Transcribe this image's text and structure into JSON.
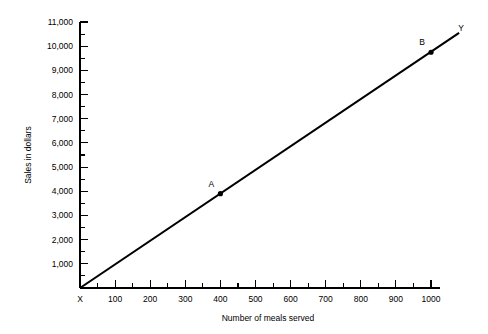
{
  "chart_data": {
    "type": "line",
    "title": "",
    "subtitle": "",
    "xlabel": "Number of meals served",
    "ylabel": "Sales in dollars",
    "xlim": [
      0,
      1000
    ],
    "ylim": [
      0,
      11000
    ],
    "grid": false,
    "legend": null,
    "x_origin_label": "X",
    "y_terminal_label": "Y",
    "x_ticks": [
      {
        "value": 0,
        "label": "X"
      },
      {
        "value": 100,
        "label": "100"
      },
      {
        "value": 200,
        "label": "200"
      },
      {
        "value": 300,
        "label": "300"
      },
      {
        "value": 400,
        "label": "400"
      },
      {
        "value": 500,
        "label": "500"
      },
      {
        "value": 600,
        "label": "600"
      },
      {
        "value": 700,
        "label": "700"
      },
      {
        "value": 800,
        "label": "800"
      },
      {
        "value": 900,
        "label": "900"
      },
      {
        "value": 1000,
        "label": "1000"
      }
    ],
    "x_minor_ticks": [
      50,
      150,
      250,
      350,
      450,
      550,
      650,
      750,
      850,
      950
    ],
    "y_ticks": [
      {
        "value": 1000,
        "label": "1,000"
      },
      {
        "value": 2000,
        "label": "2,000"
      },
      {
        "value": 3000,
        "label": "3,000"
      },
      {
        "value": 4000,
        "label": "4,000"
      },
      {
        "value": 5000,
        "label": "5,000"
      },
      {
        "value": 6000,
        "label": "6,000"
      },
      {
        "value": 7000,
        "label": "7,000"
      },
      {
        "value": 8000,
        "label": "8,000"
      },
      {
        "value": 9000,
        "label": "9,000"
      },
      {
        "value": 10000,
        "label": "10,000"
      },
      {
        "value": 11000,
        "label": "11,000"
      }
    ],
    "y_minor_ticks": [
      500,
      1500,
      2500,
      3500,
      4500,
      5500,
      6500,
      7500,
      8500,
      9500,
      10500
    ],
    "series": [
      {
        "name": "Sales trend line",
        "x": [
          0,
          1080
        ],
        "values": [
          0,
          10550
        ],
        "color": "#000000"
      }
    ],
    "annotated_points": [
      {
        "label": "A",
        "x": 400,
        "y": 3900
      },
      {
        "label": "B",
        "x": 1000,
        "y": 9750
      }
    ]
  },
  "colors": {
    "background": "#ffffff",
    "ink": "#000000"
  }
}
